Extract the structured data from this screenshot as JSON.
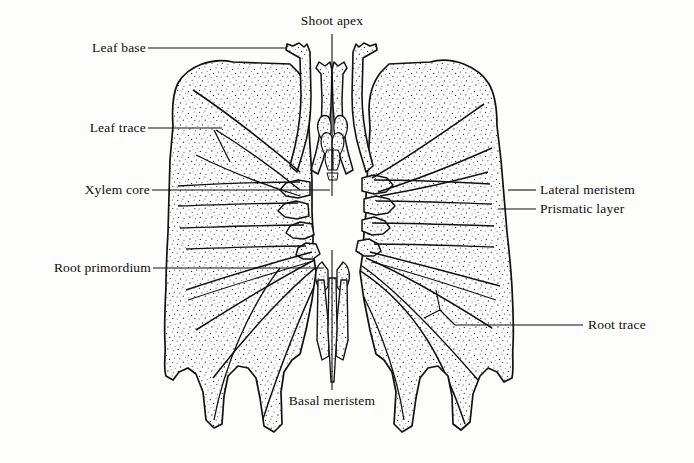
{
  "figure": {
    "type": "botanical-anatomical-diagram",
    "background_color": "#fdfdfc",
    "ink_color": "#111111",
    "stipple_color": "#1c1c1c"
  },
  "labels": {
    "leaf_base": "Leaf base",
    "leaf_trace": "Leaf trace",
    "xylem_core": "Xylem core",
    "root_primordium": "Root primordium",
    "shoot_apex": "Shoot apex",
    "basal_meristem": "Basal meristem",
    "lateral_meristem": "Lateral meristem",
    "prismatic_layer": "Prismatic layer",
    "root_trace": "Root trace"
  },
  "label_positions": {
    "leaf_base": {
      "x": 78,
      "y": 40,
      "side": "left"
    },
    "leaf_trace": {
      "x": 78,
      "y": 120,
      "side": "left"
    },
    "xylem_core": {
      "x": 68,
      "y": 182,
      "side": "left"
    },
    "root_primordium": {
      "x": 24,
      "y": 260,
      "side": "left"
    },
    "shoot_apex": {
      "x": 288,
      "y": 13,
      "side": "top"
    },
    "basal_meristem": {
      "x": 301,
      "y": 393,
      "side": "bottom"
    },
    "lateral_meristem": {
      "x": 540,
      "y": 182,
      "side": "right"
    },
    "prismatic_layer": {
      "x": 540,
      "y": 201,
      "side": "right"
    },
    "root_trace": {
      "x": 588,
      "y": 315,
      "side": "right"
    }
  },
  "leaders": {
    "leaf_base": {
      "x1": 148,
      "y1": 48,
      "x2": 287,
      "y2": 48
    },
    "leaf_trace": {
      "x1": 148,
      "y1": 128,
      "x2": 222,
      "y2": 128
    },
    "xylem_core": {
      "x1": 152,
      "y1": 190,
      "x2": 330,
      "y2": 190
    },
    "root_primordium": {
      "x1": 153,
      "y1": 268,
      "x2": 323,
      "y2": 268
    },
    "shoot_apex": {
      "x1": 332,
      "y1": 34,
      "x2": 332,
      "y2": 196
    },
    "basal_meristem": {
      "x1": 332,
      "y1": 250,
      "x2": 332,
      "y2": 390
    },
    "lateral_meristem": {
      "x1": 512,
      "y1": 190,
      "x2": 536,
      "y2": 190
    },
    "prismatic_layer": {
      "x1": 498,
      "y1": 209,
      "x2": 536,
      "y2": 209
    },
    "root_trace": {
      "x1": 455,
      "y1": 325,
      "x2": 583,
      "y2": 325
    }
  },
  "structures": {
    "left_half": "mirrored stippled corm tissue mass",
    "right_half": "stippled corm tissue mass",
    "apex_center": "shoot apex with enclosing leaf primordia",
    "basal_center": "basal meristem with root primordia",
    "lateral_meristem_tips": 8,
    "root_projections": 6,
    "leaf_trace_count": 4,
    "root_trace_count": 5
  }
}
